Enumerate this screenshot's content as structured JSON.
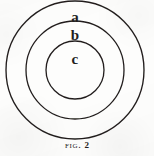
{
  "figure": {
    "kind": "concentric-circles-diagram",
    "background_color": "#fdfdfc",
    "ink_color": "#231f1e",
    "caption": {
      "prefix": "Fig.",
      "number": "2",
      "full_text": "FIG. 2"
    },
    "geometry": {
      "center_x": 75,
      "center_y": 70,
      "stroke_width": 1.3
    },
    "circles": [
      {
        "id": "outer",
        "label": "a",
        "radius": 69,
        "label_x": 75,
        "label_y": 18
      },
      {
        "id": "middle",
        "label": "b",
        "radius": 49,
        "label_x": 75,
        "label_y": 36
      },
      {
        "id": "inner",
        "label": "c",
        "radius": 29,
        "label_x": 75,
        "label_y": 60
      }
    ]
  }
}
